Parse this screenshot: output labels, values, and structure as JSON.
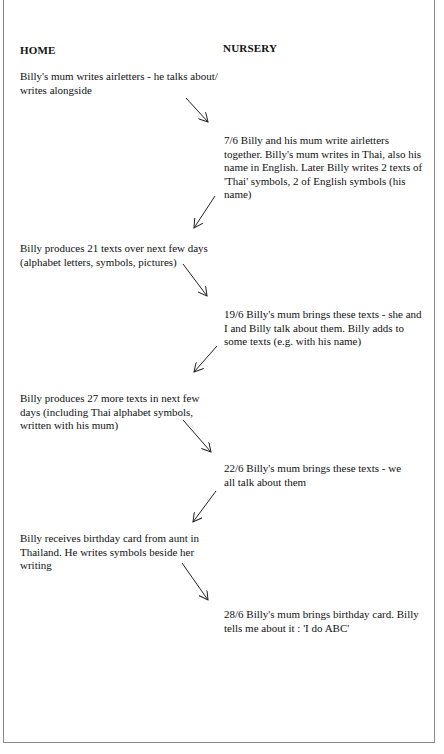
{
  "columns": {
    "home": "HOME",
    "nursery": "NURSERY"
  },
  "home_entries": [
    "Billy's mum writes airletters - he talks about/ writes alongside",
    "Billy produces 21 texts over next few days (alphabet letters, symbols, pictures)",
    "Billy produces 27 more texts in next few days (including Thai alphabet symbols, written with his mum)",
    "Billy receives birthday card from aunt in Thailand. He writes symbols beside her writing"
  ],
  "nursery_entries": [
    "7/6  Billy and his mum write airletters together. Billy's mum writes in Thai, also his name in English. Later Billy writes 2 texts of 'Thai' symbols, 2 of English symbols (his name)",
    "19/6  Billy's mum brings these texts - she and I and Billy talk about them. Billy adds to some texts (e.g. with his name)",
    "22/6 Billy's mum brings these texts - we all talk about them",
    "28/6  Billy's mum brings birthday card. Billy tells me about it : 'I do ABC'"
  ],
  "arrows": [
    {
      "direction": "home-to-nursery",
      "x1": 186,
      "y1": 98,
      "x2": 208,
      "y2": 122
    },
    {
      "direction": "nursery-to-home",
      "x1": 215,
      "y1": 196,
      "x2": 194,
      "y2": 228
    },
    {
      "direction": "home-to-nursery",
      "x1": 183,
      "y1": 264,
      "x2": 207,
      "y2": 296
    },
    {
      "direction": "nursery-to-home",
      "x1": 217,
      "y1": 346,
      "x2": 194,
      "y2": 372
    },
    {
      "direction": "home-to-nursery",
      "x1": 183,
      "y1": 420,
      "x2": 211,
      "y2": 452
    },
    {
      "direction": "nursery-to-home",
      "x1": 216,
      "y1": 491,
      "x2": 193,
      "y2": 522
    },
    {
      "direction": "home-to-nursery",
      "x1": 182,
      "y1": 563,
      "x2": 208,
      "y2": 600
    }
  ]
}
